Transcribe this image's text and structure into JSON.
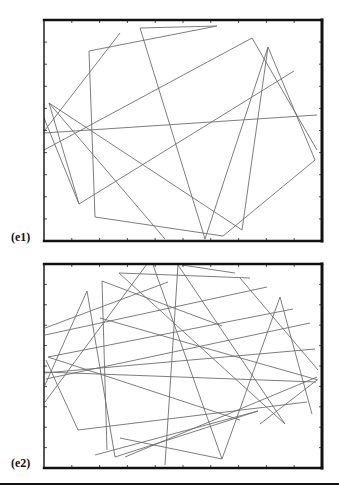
{
  "figure": {
    "panels": [
      {
        "id": "e1",
        "label": "(e1)",
        "frame": {
          "x": 44,
          "y": 20,
          "w": 278,
          "h": 221
        },
        "x_ticks": 10,
        "y_ticks": 10,
        "line_color": "#6e6e6e",
        "segments": [
          [
            [
              45,
              130
            ],
            [
              120,
              33
            ]
          ],
          [
            [
              49,
              103
            ],
            [
              165,
              239
            ]
          ],
          [
            [
              140,
              28
            ],
            [
              205,
              239
            ]
          ],
          [
            [
              140,
              28
            ],
            [
              217,
              26
            ]
          ],
          [
            [
              89,
              51
            ],
            [
              217,
              26
            ]
          ],
          [
            [
              89,
              51
            ],
            [
              95,
              217
            ]
          ],
          [
            [
              95,
              217
            ],
            [
              223,
              236
            ]
          ],
          [
            [
              223,
              236
            ],
            [
              315,
              160
            ]
          ],
          [
            [
              315,
              160
            ],
            [
              268,
              47
            ]
          ],
          [
            [
              268,
              47
            ],
            [
              242,
              230
            ]
          ],
          [
            [
              242,
              230
            ],
            [
              49,
              103
            ]
          ],
          [
            [
              44,
              150
            ],
            [
              252,
              38
            ]
          ],
          [
            [
              252,
              38
            ],
            [
              317,
              150
            ]
          ],
          [
            [
              44,
              133
            ],
            [
              317,
              115
            ]
          ],
          [
            [
              79,
              204
            ],
            [
              294,
              71
            ]
          ],
          [
            [
              79,
              204
            ],
            [
              49,
              103
            ]
          ],
          [
            [
              205,
              239
            ],
            [
              268,
              47
            ]
          ],
          [
            [
              44,
              118
            ],
            [
              79,
              204
            ]
          ]
        ]
      },
      {
        "id": "e2",
        "label": "(e2)",
        "frame": {
          "x": 44,
          "y": 264,
          "w": 278,
          "h": 204
        },
        "x_ticks": 10,
        "y_ticks": 10,
        "line_color": "#6e6e6e",
        "segments": [
          [
            [
              178,
              265
            ],
            [
              165,
              465
            ]
          ],
          [
            [
              178,
              265
            ],
            [
              285,
              424
            ]
          ],
          [
            [
              182,
              265
            ],
            [
              235,
              273
            ]
          ],
          [
            [
              119,
              273
            ],
            [
              250,
              278
            ]
          ],
          [
            [
              119,
              273
            ],
            [
              285,
              424
            ]
          ],
          [
            [
              102,
              281
            ],
            [
              107,
              450
            ]
          ],
          [
            [
              102,
              281
            ],
            [
              222,
              326
            ]
          ],
          [
            [
              87,
              291
            ],
            [
              115,
              457
            ]
          ],
          [
            [
              87,
              291
            ],
            [
              45,
              385
            ]
          ],
          [
            [
              45,
              335
            ],
            [
              267,
              287
            ]
          ],
          [
            [
              48,
              357
            ],
            [
              293,
              309
            ]
          ],
          [
            [
              48,
              357
            ],
            [
              240,
              420
            ]
          ],
          [
            [
              44,
              372
            ],
            [
              316,
              382
            ]
          ],
          [
            [
              44,
              373
            ],
            [
              315,
              349
            ]
          ],
          [
            [
              78,
              430
            ],
            [
              307,
              402
            ]
          ],
          [
            [
              78,
              430
            ],
            [
              46,
              360
            ]
          ],
          [
            [
              125,
              457
            ],
            [
              317,
              377
            ]
          ],
          [
            [
              222,
              459
            ],
            [
              280,
              297
            ]
          ],
          [
            [
              280,
              297
            ],
            [
              312,
              414
            ]
          ],
          [
            [
              222,
              459
            ],
            [
              152,
              262
            ]
          ],
          [
            [
              222,
              459
            ],
            [
              120,
              438
            ]
          ],
          [
            [
              115,
              457
            ],
            [
              258,
              411
            ]
          ],
          [
            [
              45,
              402
            ],
            [
              150,
              260
            ]
          ],
          [
            [
              100,
              318
            ],
            [
              318,
              380
            ]
          ],
          [
            [
              240,
              278
            ],
            [
              318,
              370
            ]
          ],
          [
            [
              45,
              328
            ],
            [
              168,
              282
            ]
          ],
          [
            [
              46,
              379
            ],
            [
              310,
              323
            ]
          ],
          [
            [
              260,
              424
            ],
            [
              317,
              380
            ]
          ],
          [
            [
              95,
              455
            ],
            [
              258,
              411
            ]
          ]
        ]
      }
    ],
    "divider_y": 483
  }
}
